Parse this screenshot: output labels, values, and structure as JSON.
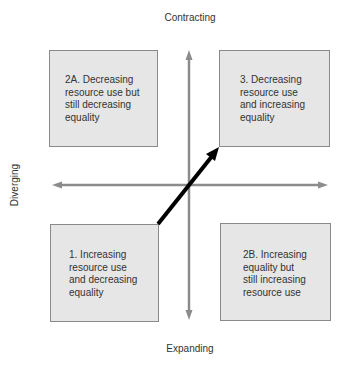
{
  "axes": {
    "top": "Contracting",
    "bottom": "Expanding",
    "left": "Diverging"
  },
  "quadrants": [
    {
      "id": "2A",
      "text": "2A. Decreasing resource use but still decreasing equality",
      "lines": [
        "2A. Decreasing",
        "resource use but",
        "still decreasing",
        "equality"
      ]
    },
    {
      "id": "3",
      "text": "3. Decreasing resource use and increasing equality",
      "lines": [
        "3. Decreasing",
        "resource use",
        "and increasing",
        "equality"
      ]
    },
    {
      "id": "1",
      "text": "1. Increasing resource use and decreasing equality",
      "lines": [
        "1. Increasing",
        "resource use",
        "and decreasing",
        "equality"
      ]
    },
    {
      "id": "2B",
      "text": "2B. Increasing equality but still increasing resource use",
      "lines": [
        "2B. Increasing",
        "equality but",
        "still increasing",
        "resource use"
      ]
    }
  ],
  "colors": {
    "box_fill": "#e6e6e6",
    "box_border": "#8a8a8a",
    "axis": "#8c8c8c",
    "trajectory_arrow": "#000000"
  }
}
